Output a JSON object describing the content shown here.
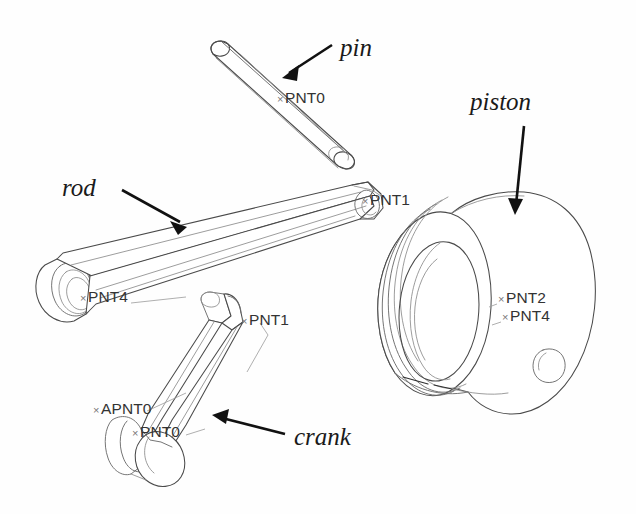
{
  "figure": {
    "title": "",
    "background_color": "#fefefe",
    "line_color": "#4a4a4a",
    "label_color": "#1a1a1a",
    "datum_color": "#333333"
  },
  "parts": [
    {
      "id": "pin",
      "label": "pin",
      "label_x": 340,
      "label_y": 56,
      "arrow": {
        "x1": 332,
        "y1": 45,
        "x2": 282,
        "y2": 78
      }
    },
    {
      "id": "rod",
      "label": "rod",
      "label_x": 62,
      "label_y": 196,
      "arrow": {
        "x1": 122,
        "y1": 190,
        "x2": 186,
        "y2": 227
      }
    },
    {
      "id": "piston",
      "label": "piston",
      "label_x": 470,
      "label_y": 110,
      "arrow": {
        "x1": 524,
        "y1": 126,
        "x2": 515,
        "y2": 215
      }
    },
    {
      "id": "crank",
      "label": "crank",
      "label_x": 294,
      "label_y": 445,
      "arrow": {
        "x1": 285,
        "y1": 434,
        "x2": 213,
        "y2": 415
      }
    }
  ],
  "datum_points": [
    {
      "id": "pin-pnt0",
      "text": "PNT0",
      "x": 285,
      "y": 103,
      "marker_x": 277,
      "marker_y": 99
    },
    {
      "id": "rod-pnt1",
      "text": "PNT1",
      "x": 370,
      "y": 205,
      "marker_x": 362,
      "marker_y": 201
    },
    {
      "id": "rod-pnt4",
      "text": "PNT4",
      "x": 88,
      "y": 302,
      "marker_x": 80,
      "marker_y": 298
    },
    {
      "id": "crank-pnt1",
      "text": "PNT1",
      "x": 249,
      "y": 325,
      "marker_x": 241,
      "marker_y": 321
    },
    {
      "id": "crank-apnt0",
      "text": "APNT0",
      "x": 101,
      "y": 414,
      "marker_x": 93,
      "marker_y": 410
    },
    {
      "id": "crank-pnt0",
      "text": "PNT0",
      "x": 140,
      "y": 437,
      "marker_x": 132,
      "marker_y": 433
    },
    {
      "id": "piston-pnt2",
      "text": "PNT2",
      "x": 506,
      "y": 303,
      "marker_x": 498,
      "marker_y": 299
    },
    {
      "id": "piston-pnt4",
      "text": "PNT4",
      "x": 510,
      "y": 321,
      "marker_x": 502,
      "marker_y": 317
    }
  ],
  "datum_marker_glyph": "×"
}
